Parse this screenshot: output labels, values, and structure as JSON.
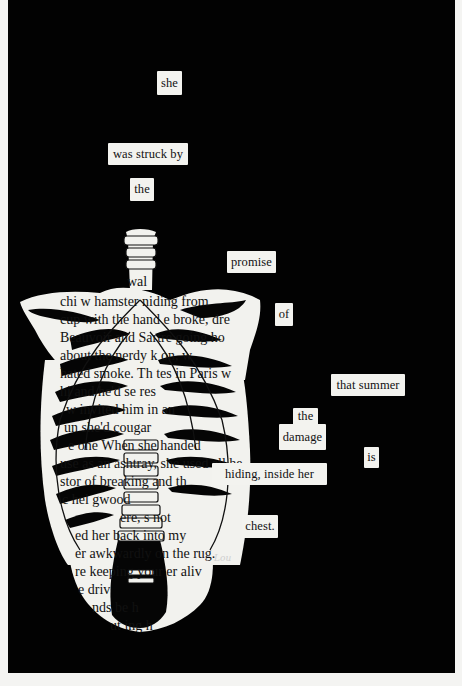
{
  "artwork": {
    "type": "blackout poetry",
    "background_color": "#020202",
    "paper_color": "#f3f3ef",
    "signature": "Lou"
  },
  "poem": {
    "words": [
      {
        "text": "she",
        "x": 157,
        "y": 71,
        "w": 25,
        "h": 24
      },
      {
        "text": "was struck by",
        "x": 108,
        "y": 143,
        "w": 80,
        "h": 22
      },
      {
        "text": "the",
        "x": 130,
        "y": 178,
        "w": 24,
        "h": 23
      },
      {
        "text": "promise",
        "x": 227,
        "y": 251,
        "w": 49,
        "h": 22
      },
      {
        "text": "of",
        "x": 275,
        "y": 303,
        "w": 18,
        "h": 23
      },
      {
        "text": "that summer",
        "x": 331,
        "y": 374,
        "w": 74,
        "h": 22
      },
      {
        "text": "the",
        "x": 293,
        "y": 408,
        "w": 25,
        "h": 17
      },
      {
        "text": "damage",
        "x": 279,
        "y": 424,
        "w": 47,
        "h": 26
      },
      {
        "text": "is",
        "x": 364,
        "y": 447,
        "w": 15,
        "h": 21
      },
      {
        "text": "hiding, inside her",
        "x": 212,
        "y": 463,
        "w": 115,
        "h": 22
      },
      {
        "text": "chest.",
        "x": 242,
        "y": 515,
        "w": 36,
        "h": 23
      }
    ],
    "full_text": "she was struck by the promise of that summer the damage is hiding, inside her chest."
  },
  "book_fragments": [
    {
      "text": "wal",
      "x": 127,
      "y": 275
    },
    {
      "text": "chi        w hamster    niding from",
      "x": 60,
      "y": 295
    },
    {
      "text": "cup with the hand   e broke, dre",
      "x": 60,
      "y": 313
    },
    {
      "text": "Beauvoir and Sartre    going ho",
      "x": 60,
      "y": 331
    },
    {
      "text": "about the nerdy    k    on,  w",
      "x": 60,
      "y": 349
    },
    {
      "text": "hated smoke. Th   tes in Paris w",
      "x": 60,
      "y": 367
    },
    {
      "text": "hi   and  he'd se        res",
      "x": 60,
      "y": 385
    },
    {
      "text": "w      invited him in an",
      "x": 66,
      "y": 403
    },
    {
      "text": "un         she'd     cougar",
      "x": 64,
      "y": 421
    },
    {
      "text": "e one    When she handed",
      "x": 68,
      "y": 439
    },
    {
      "text": "use as an ashtray, she used all he",
      "x": 60,
      "y": 457
    },
    {
      "text": "stor  of  breaking  and  th",
      "x": 60,
      "y": 475
    },
    {
      "text": "c    hel      gwood",
      "x": 62,
      "y": 493
    },
    {
      "text": "ere,  s           not",
      "x": 120,
      "y": 511
    },
    {
      "text": "ed her back into my",
      "x": 75,
      "y": 529
    },
    {
      "text": "er awkwardly on the rug.",
      "x": 75,
      "y": 547
    },
    {
      "text": "re keeping your     er aliv",
      "x": 75,
      "y": 565
    },
    {
      "text": "e driv",
      "x": 78,
      "y": 583
    },
    {
      "text": "nds               be h",
      "x": 92,
      "y": 601
    },
    {
      "text": "ut    ing  h",
      "x": 110,
      "y": 619
    }
  ]
}
